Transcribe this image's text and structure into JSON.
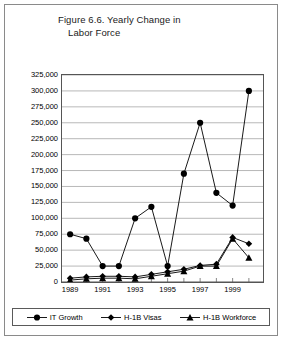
{
  "figure": {
    "title_line_1": "Figure 6.6. Yearly Change in",
    "title_line_2": "Labor Force"
  },
  "legend": {
    "items": [
      {
        "label": "IT Growth",
        "marker": "circle-marker-icon"
      },
      {
        "label": "H-1B Visas",
        "marker": "diamond-marker-icon"
      },
      {
        "label": "H-1B Workforce",
        "marker": "triangle-marker-icon"
      }
    ]
  },
  "axis": {
    "y_ticks": [
      "325,000",
      "300,000",
      "275,000",
      "250,000",
      "225,000",
      "200,000",
      "175,000",
      "150,000",
      "125,000",
      "100,000",
      "75,000",
      "50,000",
      "25,000",
      "0"
    ],
    "x_ticks_visible": [
      "1989",
      "1991",
      "1993",
      "1995",
      "1997",
      "1999"
    ]
  },
  "chart_data": {
    "type": "line",
    "title": "Figure 6.6. Yearly Change in Labor Force",
    "xlabel": "",
    "ylabel": "",
    "ylim": [
      0,
      325000
    ],
    "ytick_step": 25000,
    "grid": "horizontal",
    "legend_position": "bottom",
    "categories": [
      1989,
      1990,
      1991,
      1992,
      1993,
      1994,
      1995,
      1996,
      1997,
      1998,
      1999,
      2000
    ],
    "x_tick_labels": [
      "1989",
      "",
      "1991",
      "",
      "1993",
      "",
      "1995",
      "",
      "1997",
      "",
      "1999",
      ""
    ],
    "series": [
      {
        "name": "IT Growth",
        "marker": "circle",
        "values": [
          75000,
          68000,
          25000,
          25000,
          100000,
          118000,
          25000,
          170000,
          250000,
          140000,
          120000,
          300000
        ]
      },
      {
        "name": "H-1B Visas",
        "marker": "diamond",
        "values": [
          6000,
          8000,
          9000,
          9000,
          8000,
          12000,
          16000,
          20000,
          26000,
          28000,
          70000,
          60000
        ]
      },
      {
        "name": "H-1B Workforce",
        "marker": "triangle",
        "values": [
          3000,
          5000,
          6000,
          6000,
          5000,
          9000,
          13000,
          17000,
          25000,
          25000,
          68000,
          38000
        ]
      }
    ]
  }
}
